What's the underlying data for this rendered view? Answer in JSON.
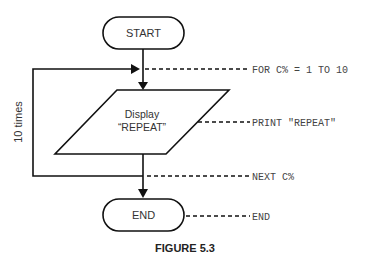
{
  "flowchart": {
    "start_label": "START",
    "process_label_line1": "Display",
    "process_label_line2": "“REPEAT”",
    "end_label": "END",
    "loop_label": "10 times"
  },
  "annotations": {
    "for_statement": "FOR C% = 1 TO 10",
    "print_statement": "PRINT \"REPEAT\"",
    "next_statement": "NEXT C%",
    "end_statement": "END"
  },
  "caption": "FIGURE 5.3"
}
